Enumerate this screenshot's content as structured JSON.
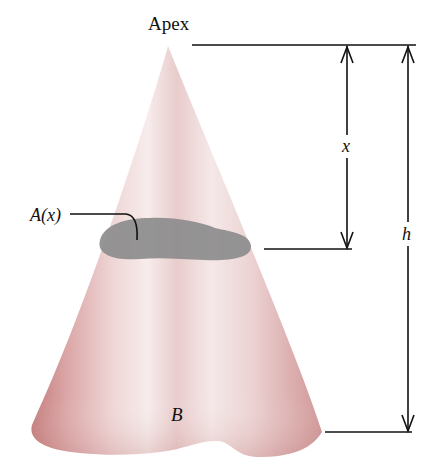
{
  "figure": {
    "labels": {
      "apex": "Apex",
      "cross_section": "A(x)",
      "distance": "x",
      "height": "h",
      "base": "B"
    },
    "colors": {
      "cone_edge": "#c98585",
      "cone_mid": "#e2b7b7",
      "cone_highlight": "#f6eaea",
      "cross_section": "#8c8c8c",
      "lines": "#111111",
      "background": "#ffffff"
    }
  }
}
